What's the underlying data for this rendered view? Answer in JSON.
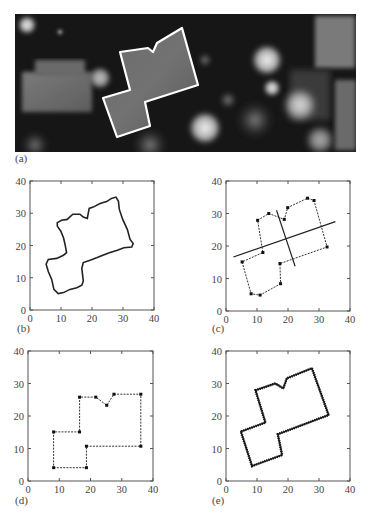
{
  "figure": {
    "panels": [
      {
        "id": "a",
        "label": "(a)"
      },
      {
        "id": "b",
        "label": "(b)"
      },
      {
        "id": "c",
        "label": "(c)"
      },
      {
        "id": "d",
        "label": "(d)"
      },
      {
        "id": "e",
        "label": "(e)"
      }
    ]
  },
  "panel_a": {
    "label": "(a)",
    "description": "Grayscale aerial elevation image with white building outline",
    "outline_color": "#ffffff",
    "outline_px": [
      [
        120,
        52
      ],
      [
        148,
        48
      ],
      [
        153,
        52
      ],
      [
        157,
        43
      ],
      [
        182,
        28
      ],
      [
        198,
        85
      ],
      [
        145,
        102
      ],
      [
        150,
        126
      ],
      [
        117,
        137
      ],
      [
        103,
        98
      ],
      [
        130,
        90
      ]
    ]
  },
  "chart_data": [
    {
      "panel": "(b)",
      "type": "line",
      "title": "",
      "xlabel": "",
      "ylabel": "",
      "xlim": [
        0,
        40
      ],
      "ylim": [
        0,
        40
      ],
      "x_tick_labels": [
        "0",
        "10",
        "20",
        "30",
        "40"
      ],
      "y_tick_labels": [
        "0",
        "10",
        "20",
        "30",
        "40"
      ],
      "grid": false,
      "series": [
        {
          "name": "raw boundary (staircase)",
          "style": "solid",
          "points": [
            [
              8.8,
              27.1
            ],
            [
              10.2,
              27.8
            ],
            [
              12.0,
              28.1
            ],
            [
              13.8,
              29.7
            ],
            [
              16.1,
              29.7
            ],
            [
              17.2,
              28.8
            ],
            [
              18.5,
              28.4
            ],
            [
              19.1,
              31.5
            ],
            [
              20.4,
              31.9
            ],
            [
              22.6,
              33.0
            ],
            [
              24.7,
              33.6
            ],
            [
              26.3,
              34.6
            ],
            [
              27.7,
              35.0
            ],
            [
              28.5,
              33.8
            ],
            [
              28.8,
              31.2
            ],
            [
              29.9,
              28.1
            ],
            [
              31.4,
              25.0
            ],
            [
              32.3,
              21.9
            ],
            [
              33.3,
              20.6
            ],
            [
              32.8,
              19.5
            ],
            [
              30.3,
              19.3
            ],
            [
              28.2,
              18.5
            ],
            [
              25.8,
              17.8
            ],
            [
              23.7,
              17.1
            ],
            [
              21.5,
              16.2
            ],
            [
              19.4,
              15.4
            ],
            [
              17.2,
              14.7
            ],
            [
              16.7,
              12.9
            ],
            [
              17.2,
              9.0
            ],
            [
              16.7,
              7.7
            ],
            [
              15.1,
              6.9
            ],
            [
              12.9,
              6.4
            ],
            [
              10.8,
              5.4
            ],
            [
              9.1,
              5.1
            ],
            [
              7.7,
              6.4
            ],
            [
              7.0,
              9.5
            ],
            [
              5.9,
              11.9
            ],
            [
              5.2,
              14.2
            ],
            [
              5.9,
              15.7
            ],
            [
              8.6,
              16.0
            ],
            [
              10.8,
              17.0
            ],
            [
              11.8,
              17.8
            ],
            [
              11.3,
              20.4
            ],
            [
              10.8,
              22.4
            ],
            [
              9.9,
              24.5
            ],
            [
              8.8,
              26.0
            ]
          ]
        }
      ]
    },
    {
      "panel": "(c)",
      "type": "line",
      "title": "",
      "xlabel": "",
      "ylabel": "",
      "xlim": [
        0,
        40
      ],
      "ylim": [
        0,
        40
      ],
      "x_tick_labels": [
        "0",
        "10",
        "20",
        "30",
        "40"
      ],
      "y_tick_labels": [
        "0",
        "10",
        "20",
        "30",
        "40"
      ],
      "grid": false,
      "series": [
        {
          "name": "simplified vertices",
          "style": "dashed-with-markers",
          "points": [
            [
              10.2,
              27.9
            ],
            [
              13.8,
              30.0
            ],
            [
              18.8,
              28.2
            ],
            [
              19.9,
              31.8
            ],
            [
              26.3,
              34.7
            ],
            [
              28.4,
              34.0
            ],
            [
              32.6,
              19.7
            ],
            [
              17.4,
              14.6
            ],
            [
              17.6,
              8.4
            ],
            [
              11.0,
              4.9
            ],
            [
              8.1,
              5.3
            ],
            [
              5.2,
              15.1
            ],
            [
              11.9,
              18.0
            ]
          ]
        },
        {
          "name": "principal axis",
          "style": "solid",
          "points": [
            [
              2.4,
              16.6
            ],
            [
              35.3,
              27.5
            ]
          ]
        },
        {
          "name": "secondary axis",
          "style": "solid",
          "points": [
            [
              16.3,
              31.0
            ],
            [
              22.3,
              13.8
            ]
          ]
        }
      ]
    },
    {
      "panel": "(d)",
      "type": "line",
      "title": "",
      "xlabel": "",
      "ylabel": "",
      "xlim": [
        0,
        40
      ],
      "ylim": [
        0,
        40
      ],
      "x_tick_labels": [
        "0",
        "10",
        "20",
        "30",
        "40"
      ],
      "y_tick_labels": [
        "0",
        "10",
        "20",
        "30",
        "40"
      ],
      "grid": false,
      "series": [
        {
          "name": "rotated/regularized vertices",
          "style": "dashed-with-markers",
          "points": [
            [
              8.2,
              4.1
            ],
            [
              18.7,
              4.1
            ],
            [
              18.7,
              10.7
            ],
            [
              36.1,
              10.7
            ],
            [
              36.1,
              26.7
            ],
            [
              27.5,
              26.7
            ],
            [
              25.2,
              23.3
            ],
            [
              21.7,
              25.8
            ],
            [
              16.5,
              25.8
            ],
            [
              16.5,
              15.1
            ],
            [
              8.2,
              15.1
            ]
          ]
        }
      ]
    },
    {
      "panel": "(e)",
      "type": "line",
      "title": "",
      "xlabel": "",
      "ylabel": "",
      "xlim": [
        0,
        40
      ],
      "ylim": [
        0,
        40
      ],
      "x_tick_labels": [
        "0",
        "10",
        "20",
        "30",
        "40"
      ],
      "y_tick_labels": [
        "0",
        "10",
        "20",
        "30",
        "40"
      ],
      "grid": false,
      "series": [
        {
          "name": "final outline",
          "style": "solid",
          "points": [
            [
              9.5,
              27.9
            ],
            [
              15.9,
              30.0
            ],
            [
              18.5,
              28.5
            ],
            [
              19.6,
              31.6
            ],
            [
              27.7,
              34.7
            ],
            [
              33.1,
              20.3
            ],
            [
              16.7,
              14.4
            ],
            [
              18.1,
              8.0
            ],
            [
              8.4,
              4.6
            ],
            [
              4.8,
              15.2
            ],
            [
              12.7,
              18.0
            ]
          ]
        },
        {
          "name": "raw boundary (dotted)",
          "style": "dotted",
          "points": [
            [
              9.5,
              27.9
            ],
            [
              15.9,
              30.0
            ],
            [
              18.5,
              28.5
            ],
            [
              19.6,
              31.6
            ],
            [
              27.7,
              34.7
            ],
            [
              33.1,
              20.3
            ],
            [
              16.7,
              14.4
            ],
            [
              18.1,
              8.0
            ],
            [
              8.4,
              4.6
            ],
            [
              4.8,
              15.2
            ],
            [
              12.7,
              18.0
            ]
          ]
        }
      ]
    }
  ]
}
